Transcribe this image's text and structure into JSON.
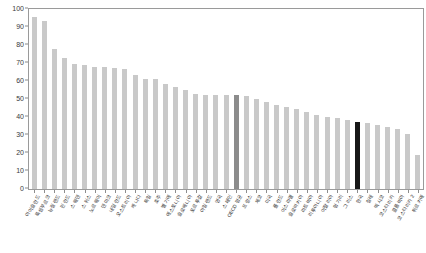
{
  "chart_data": {
    "type": "bar",
    "title": "",
    "subtitle": "",
    "xlabel": "",
    "ylabel": "",
    "ylim": [
      0,
      100
    ],
    "yticks": [
      0,
      10,
      20,
      30,
      40,
      50,
      60,
      70,
      80,
      90,
      100
    ],
    "grid": false,
    "legend": "none",
    "bar_color_default": "#c9c9c9",
    "bar_color_highlight_gray": "#8c8c8c",
    "bar_color_highlight_black": "#181818",
    "axis_color": "#9a9a9a",
    "tick_label_color": "#3a3a3a",
    "sorted": "descending",
    "categories": [
      "아이슬란드",
      "룩셈부르크",
      "뉴질랜드",
      "핀란드",
      "스웨덴",
      "스위스",
      "노르웨이",
      "덴마크",
      "네덜란드",
      "오스트리아",
      "캐나다",
      "독일",
      "호주",
      "벨기에",
      "에스토니아",
      "슬로베니아",
      "포르투갈",
      "아일랜드",
      "영국",
      "스페인",
      "OECD 평균",
      "프랑스",
      "체코",
      "미국",
      "폴란드",
      "이스라엘",
      "슬로바키아",
      "라트비아",
      "리투아니아",
      "이탈리아",
      "헝가리",
      "그리스",
      "한국",
      "칠레",
      "멕시코",
      "코스타리카",
      "콜롬비아",
      "코스타리카 2",
      "튀르키예"
    ],
    "values": [
      95.5,
      93.5,
      78.0,
      73.0,
      69.5,
      69.0,
      68.0,
      68.0,
      67.5,
      66.5,
      63.5,
      61.0,
      61.0,
      58.5,
      56.5,
      55.0,
      53.0,
      52.5,
      52.0,
      52.0,
      52.0,
      51.5,
      50.0,
      48.5,
      46.5,
      45.5,
      44.5,
      43.0,
      41.0,
      40.0,
      39.5,
      38.5,
      37.0,
      36.5,
      35.5,
      34.5,
      33.5,
      30.5,
      19.0
    ],
    "highlight": {
      "gray_index": 20,
      "gray_label": "OECD 평균",
      "gray_value": 52.0,
      "black_index": 32,
      "black_label": "한국",
      "black_value": 37.0
    }
  }
}
